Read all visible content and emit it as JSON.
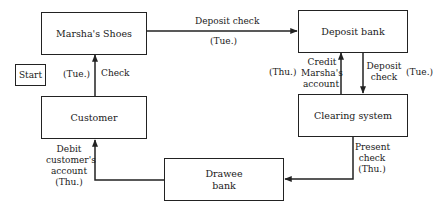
{
  "diagram": {
    "nodes": {
      "marshas_shoes": "Marsha's Shoes",
      "deposit_bank": "Deposit bank",
      "customer": "Customer",
      "clearing_system": "Clearing system",
      "drawee_bank_line1": "Drawee",
      "drawee_bank_line2": "bank",
      "start": "Start"
    },
    "edges": {
      "customer_to_shoes": {
        "label": "Check",
        "day": "(Tue.)"
      },
      "shoes_to_deposit_bank": {
        "label": "Deposit check",
        "day": "(Tue.)"
      },
      "deposit_bank_to_clearing": {
        "label_line1": "Deposit",
        "label_line2": "check",
        "day": "(Tue.)"
      },
      "clearing_to_deposit_bank": {
        "label_line1": "Credit",
        "label_line2": "Marsha's",
        "label_line3": "account",
        "day": "(Thu.)"
      },
      "clearing_to_drawee": {
        "label_line1": "Present",
        "label_line2": "check",
        "day": "(Thu.)"
      },
      "drawee_to_customer": {
        "label_line1": "Debit",
        "label_line2": "customer's",
        "label_line3": "account",
        "day": "(Thu.)"
      }
    },
    "colors": {
      "stroke": "#222222",
      "background": "#ffffff"
    }
  }
}
